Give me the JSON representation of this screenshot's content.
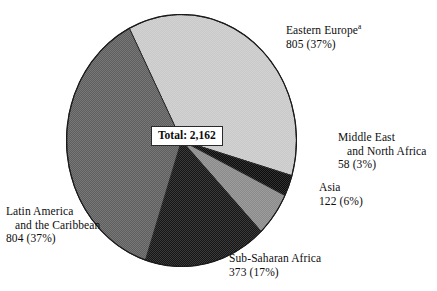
{
  "chart_data": {
    "type": "pie",
    "title": "",
    "total_label": "Total: 2,162",
    "total_value": 2162,
    "units": "",
    "legend": "none",
    "labels_position": "outside-callout",
    "categories": [
      "Eastern Europe",
      "Middle East and North Africa",
      "Asia",
      "Sub-Saharan Africa",
      "Latin America and the Caribbean"
    ],
    "values": [
      805,
      58,
      122,
      373,
      804
    ],
    "percents": [
      37,
      3,
      6,
      17,
      37
    ],
    "colors": [
      "#c9c9c9",
      "#0b0b0b",
      "#8a8a8a",
      "#151515",
      "#5e5e5e"
    ],
    "slices": [
      {
        "name": "Eastern Europe",
        "label_line1": "Eastern Europe",
        "superscript": "a",
        "label_line2": "",
        "value_text": "805 (37%)",
        "value": 805,
        "percent": 37,
        "color": "#c9c9c9",
        "start_angle": -27,
        "sweep": 133.2
      },
      {
        "name": "Middle East and North Africa",
        "label_line1": "Middle East",
        "superscript": "",
        "label_line2": "and North Africa",
        "value_text": "58 (3%)",
        "value": 58,
        "percent": 3,
        "color": "#0b0b0b",
        "start_angle": 106.2,
        "sweep": 9.7
      },
      {
        "name": "Asia",
        "label_line1": "Asia",
        "superscript": "",
        "label_line2": "",
        "value_text": "122 (6%)",
        "value": 122,
        "percent": 6,
        "color": "#8a8a8a",
        "start_angle": 115.9,
        "sweep": 20.3
      },
      {
        "name": "Sub-Saharan Africa",
        "label_line1": "Sub-Saharan Africa",
        "superscript": "",
        "label_line2": "",
        "value_text": "373 (17%)",
        "value": 373,
        "percent": 17,
        "color": "#151515",
        "start_angle": 136.2,
        "sweep": 62.1
      },
      {
        "name": "Latin America and the Caribbean",
        "label_line1": "Latin America",
        "superscript": "",
        "label_line2": "and the Caribbean",
        "value_text": "804 (37%)",
        "value": 804,
        "percent": 37,
        "color": "#5e5e5e",
        "start_angle": 198.3,
        "sweep": 134.7
      }
    ]
  },
  "labels": {
    "eastern_europe": {
      "line1": "Eastern Europe",
      "superscript": "a",
      "value": "805 (37%)"
    },
    "middle_east": {
      "line1": "Middle East",
      "line2": "and North Africa",
      "value": "58 (3%)"
    },
    "asia": {
      "line1": "Asia",
      "value": "122 (6%)"
    },
    "latin_america": {
      "line1": "Latin America",
      "line2": "and the Caribbean",
      "value": "804 (37%)"
    },
    "subsaharan_africa": {
      "line1": "Sub-Saharan Africa",
      "value": "373 (17%)"
    },
    "total": "Total: 2,162"
  }
}
